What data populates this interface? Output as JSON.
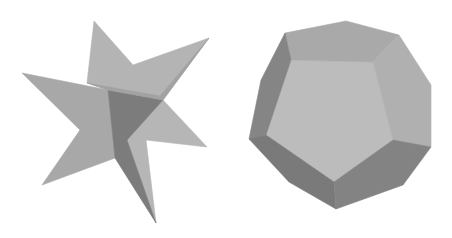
{
  "scene": {
    "width": 452,
    "height": 238,
    "background": "#ffffff",
    "colors": {
      "light": "#bababa",
      "mid": "#a6a6a6",
      "midDark": "#999999",
      "dark": "#7c7c7c",
      "darker": "#858585"
    }
  },
  "objects": [
    {
      "name": "star-polyhedron",
      "faces": [
        {
          "name": "upper-star-face",
          "fill": "#b4b4b4",
          "points": "94,21 133,65 209,38 163,100 108,90 87,83"
        },
        {
          "name": "left-star-face",
          "fill": "#a8a8a8",
          "points": "22,73 108,90 115,158 42,185 80,130"
        },
        {
          "name": "right-star-face",
          "fill": "#b6b6b6",
          "points": "163,100 207,147 146,140 156,223 127,140"
        },
        {
          "name": "center-dark-face",
          "fill": "#7c7c7c",
          "points": "108,90 163,100 127,140 156,223 115,158"
        },
        {
          "name": "upper-ridge-face",
          "fill": "#a2a2a2",
          "points": "87,83 108,90 163,100 209,38 160,96"
        }
      ]
    },
    {
      "name": "dodecahedron",
      "faces": [
        {
          "name": "front-pentagon-face",
          "fill": "#bcbcbc",
          "points": "291,60 373,62 393,140 334,182 266,135"
        },
        {
          "name": "top-face",
          "fill": "#a9a9a9",
          "points": "285,33 346,21 399,35 373,62 291,60"
        },
        {
          "name": "upper-right-face",
          "fill": "#b0b0b0",
          "points": "399,35 431,85 431,147 393,140 373,62"
        },
        {
          "name": "upper-left-face",
          "fill": "#858585",
          "points": "285,33 291,60 266,135 249,139 261,80"
        },
        {
          "name": "lower-left-face",
          "fill": "#7a7a7a",
          "points": "249,139 266,135 334,182 336,209 289,182"
        },
        {
          "name": "lower-right-face",
          "fill": "#838383",
          "points": "393,140 431,147 403,185 336,209 334,182"
        }
      ]
    }
  ]
}
